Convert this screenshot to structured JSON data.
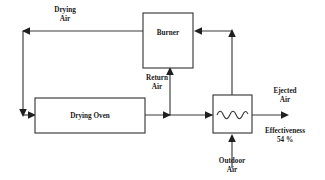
{
  "diagram": {
    "colors": {
      "line": "#3a3a3a",
      "text": "#1a1a1a",
      "background": "#ffffff",
      "arrow": "#1f1f1f"
    },
    "boxes": [
      {
        "id": "burner",
        "label": "Burner"
      },
      {
        "id": "drying_oven",
        "label": "Drying Oven"
      },
      {
        "id": "heat_exchanger",
        "label": ""
      }
    ],
    "flow_labels": [
      {
        "id": "drying_air",
        "line1": "Drying",
        "line2": "Air"
      },
      {
        "id": "return_air",
        "line1": "Return",
        "line2": "Air"
      },
      {
        "id": "outdoor_air",
        "line1": "Outdoor",
        "line2": "Air"
      },
      {
        "id": "ejected_air",
        "line1": "Ejected",
        "line2": "Air"
      }
    ],
    "annotation": {
      "label": "Effectiveness",
      "value": "54 %"
    }
  }
}
